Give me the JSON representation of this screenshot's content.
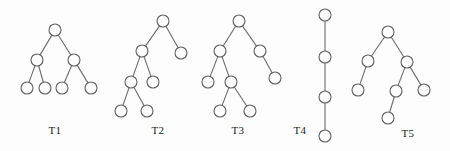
{
  "figure": {
    "background_color": "#fdfdfd",
    "node_fill": "#ffffff",
    "node_stroke": "#5f5f5f",
    "edge_stroke": "#6b6b6b",
    "node_radius": 6,
    "label_color": "#1b1b1b"
  },
  "chart_data": {
    "type": "diagram",
    "trees": [
      {
        "id": "T1",
        "label": "T1",
        "label_x": 55,
        "label_y": 130,
        "node_count": 7,
        "edge_count": 6,
        "depth": 3,
        "nodes": [
          {
            "id": "t1n0",
            "x": 55,
            "y": 30,
            "level": 0,
            "role": "root"
          },
          {
            "id": "t1n1",
            "x": 37,
            "y": 60,
            "level": 1,
            "role": "internal"
          },
          {
            "id": "t1n2",
            "x": 74,
            "y": 60,
            "level": 1,
            "role": "internal"
          },
          {
            "id": "t1n3",
            "x": 27,
            "y": 88,
            "level": 2,
            "role": "leaf"
          },
          {
            "id": "t1n4",
            "x": 45,
            "y": 88,
            "level": 2,
            "role": "leaf"
          },
          {
            "id": "t1n5",
            "x": 62,
            "y": 88,
            "level": 2,
            "role": "leaf"
          },
          {
            "id": "t1n6",
            "x": 91,
            "y": 88,
            "level": 2,
            "role": "leaf"
          }
        ],
        "edges": [
          {
            "from": "t1n0",
            "to": "t1n1"
          },
          {
            "from": "t1n0",
            "to": "t1n2"
          },
          {
            "from": "t1n1",
            "to": "t1n3"
          },
          {
            "from": "t1n1",
            "to": "t1n4"
          },
          {
            "from": "t1n2",
            "to": "t1n5"
          },
          {
            "from": "t1n2",
            "to": "t1n6"
          }
        ]
      },
      {
        "id": "T2",
        "label": "T2",
        "label_x": 158,
        "label_y": 130,
        "node_count": 7,
        "edge_count": 6,
        "depth": 4,
        "nodes": [
          {
            "id": "t2n0",
            "x": 163,
            "y": 21,
            "level": 0,
            "role": "root"
          },
          {
            "id": "t2n1",
            "x": 142,
            "y": 51,
            "level": 1,
            "role": "internal"
          },
          {
            "id": "t2n2",
            "x": 181,
            "y": 53,
            "level": 1,
            "role": "leaf"
          },
          {
            "id": "t2n3",
            "x": 131,
            "y": 82,
            "level": 2,
            "role": "internal"
          },
          {
            "id": "t2n4",
            "x": 153,
            "y": 82,
            "level": 2,
            "role": "leaf"
          },
          {
            "id": "t2n5",
            "x": 121,
            "y": 111,
            "level": 3,
            "role": "leaf"
          },
          {
            "id": "t2n6",
            "x": 147,
            "y": 111,
            "level": 3,
            "role": "leaf"
          }
        ],
        "edges": [
          {
            "from": "t2n0",
            "to": "t2n1"
          },
          {
            "from": "t2n0",
            "to": "t2n2"
          },
          {
            "from": "t2n1",
            "to": "t2n3"
          },
          {
            "from": "t2n1",
            "to": "t2n4"
          },
          {
            "from": "t2n3",
            "to": "t2n5"
          },
          {
            "from": "t2n3",
            "to": "t2n6"
          }
        ]
      },
      {
        "id": "T3",
        "label": "T3",
        "label_x": 238,
        "label_y": 130,
        "node_count": 7,
        "edge_count": 6,
        "depth": 4,
        "nodes": [
          {
            "id": "t3n0",
            "x": 239,
            "y": 21,
            "level": 0,
            "role": "root"
          },
          {
            "id": "t3n1",
            "x": 220,
            "y": 51,
            "level": 1,
            "role": "internal"
          },
          {
            "id": "t3n2",
            "x": 260,
            "y": 51,
            "level": 1,
            "role": "internal"
          },
          {
            "id": "t3n3",
            "x": 208,
            "y": 82,
            "level": 2,
            "role": "leaf"
          },
          {
            "id": "t3n4",
            "x": 231,
            "y": 82,
            "level": 2,
            "role": "internal"
          },
          {
            "id": "t3n5",
            "x": 275,
            "y": 78,
            "level": 2,
            "role": "leaf"
          },
          {
            "id": "t3n6",
            "x": 220,
            "y": 111,
            "level": 3,
            "role": "leaf"
          },
          {
            "id": "t3n7",
            "x": 250,
            "y": 111,
            "level": 3,
            "role": "leaf"
          }
        ],
        "edges": [
          {
            "from": "t3n0",
            "to": "t3n1"
          },
          {
            "from": "t3n0",
            "to": "t3n2"
          },
          {
            "from": "t3n1",
            "to": "t3n3"
          },
          {
            "from": "t3n1",
            "to": "t3n4"
          },
          {
            "from": "t3n2",
            "to": "t3n5"
          },
          {
            "from": "t3n4",
            "to": "t3n6"
          },
          {
            "from": "t3n4",
            "to": "t3n7"
          }
        ]
      },
      {
        "id": "T4",
        "label": "T4",
        "label_x": 300,
        "label_y": 130,
        "node_count": 4,
        "edge_count": 3,
        "depth": 4,
        "nodes": [
          {
            "id": "t4n0",
            "x": 325,
            "y": 15,
            "level": 0,
            "role": "root"
          },
          {
            "id": "t4n1",
            "x": 325,
            "y": 57,
            "level": 1,
            "role": "internal"
          },
          {
            "id": "t4n2",
            "x": 325,
            "y": 97,
            "level": 2,
            "role": "internal"
          },
          {
            "id": "t4n3",
            "x": 325,
            "y": 136,
            "level": 3,
            "role": "leaf"
          }
        ],
        "edges": [
          {
            "from": "t4n0",
            "to": "t4n1"
          },
          {
            "from": "t4n1",
            "to": "t4n2"
          },
          {
            "from": "t4n2",
            "to": "t4n3"
          }
        ]
      },
      {
        "id": "T5",
        "label": "T5",
        "label_x": 408,
        "label_y": 133,
        "node_count": 7,
        "edge_count": 6,
        "depth": 4,
        "nodes": [
          {
            "id": "t5n0",
            "x": 388,
            "y": 32,
            "level": 0,
            "role": "root"
          },
          {
            "id": "t5n1",
            "x": 368,
            "y": 61,
            "level": 1,
            "role": "internal"
          },
          {
            "id": "t5n2",
            "x": 407,
            "y": 62,
            "level": 1,
            "role": "internal"
          },
          {
            "id": "t5n3",
            "x": 358,
            "y": 90,
            "level": 2,
            "role": "leaf"
          },
          {
            "id": "t5n4",
            "x": 396,
            "y": 91,
            "level": 2,
            "role": "internal"
          },
          {
            "id": "t5n5",
            "x": 424,
            "y": 90,
            "level": 2,
            "role": "leaf"
          },
          {
            "id": "t5n6",
            "x": 388,
            "y": 118,
            "level": 3,
            "role": "leaf"
          }
        ],
        "edges": [
          {
            "from": "t5n0",
            "to": "t5n1"
          },
          {
            "from": "t5n0",
            "to": "t5n2"
          },
          {
            "from": "t5n1",
            "to": "t5n3"
          },
          {
            "from": "t5n2",
            "to": "t5n4"
          },
          {
            "from": "t5n2",
            "to": "t5n5"
          },
          {
            "from": "t5n4",
            "to": "t5n6"
          }
        ]
      }
    ]
  }
}
